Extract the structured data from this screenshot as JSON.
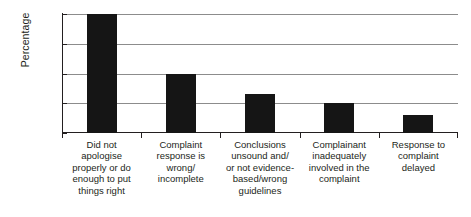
{
  "chart_data": {
    "type": "bar",
    "title": "",
    "xlabel": "",
    "ylabel": "Percentage",
    "ylim": [
      0,
      40
    ],
    "ytick_labels": [
      "40%",
      "30%",
      "20%",
      "10%",
      "0%"
    ],
    "ytick_values": [
      40,
      30,
      20,
      10,
      0
    ],
    "grid": true,
    "legend": "none",
    "bar_color": "#151515",
    "gridline_color": "#8c8c8c",
    "axis_color": "#231f20",
    "categories": [
      "Did not apologise properly or do enough to put things right",
      "Complaint response is wrong/ incomplete",
      "Conclusions unsound and/ or not evidence-based/wrong guidelines",
      "Complainant inadequately involved in the complaint",
      "Response to complaint delayed"
    ],
    "category_lines": [
      [
        "Did not",
        "apologise",
        "properly or do",
        "enough to put",
        "things right"
      ],
      [
        "Complaint",
        "response is",
        "wrong/",
        "incomplete"
      ],
      [
        "Conclusions",
        "unsound and/",
        "or not evidence-",
        "based/wrong",
        "guidelines"
      ],
      [
        "Complainant",
        "inadequately",
        "involved in the",
        "complaint"
      ],
      [
        "Response to",
        "complaint",
        "delayed"
      ]
    ],
    "values": [
      40,
      20,
      13,
      10,
      6
    ]
  }
}
